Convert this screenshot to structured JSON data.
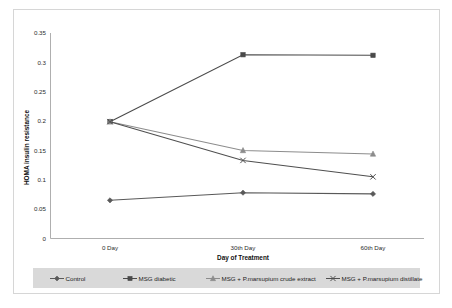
{
  "chart_data": {
    "type": "line",
    "title": "",
    "xlabel": "Day of Treatment",
    "ylabel": "HOMA insulin resistance",
    "categories": [
      "0 Day",
      "30th Day",
      "60th Day"
    ],
    "ylim": [
      0,
      0.35
    ],
    "yticks": [
      "0",
      "0.05",
      "0.1",
      "0.15",
      "0.2",
      "0.25",
      "0.3",
      "0.35"
    ],
    "ytick_values": [
      0,
      0.05,
      0.1,
      0.15,
      0.2,
      0.25,
      0.3,
      0.35
    ],
    "grid": false,
    "legend_position": "bottom",
    "series": [
      {
        "name": "Control",
        "values": [
          0.065,
          0.078,
          0.076
        ],
        "color": "#595959",
        "marker": "diamond"
      },
      {
        "name": "MSG diabetic",
        "values": [
          0.199,
          0.313,
          0.312
        ],
        "color": "#4a4a4a",
        "marker": "square"
      },
      {
        "name": "MSG + P.marsupium crude extract",
        "values": [
          0.199,
          0.15,
          0.144
        ],
        "color": "#8c8c8c",
        "marker": "triangle"
      },
      {
        "name": "MSG + P.marsupium distillate",
        "values": [
          0.199,
          0.133,
          0.105
        ],
        "color": "#4f4f4f",
        "marker": "cross"
      }
    ]
  },
  "axes": {
    "y_title": "HOMA insulin resistance",
    "x_title": "Day of Treatment"
  },
  "legend": {
    "items": [
      {
        "label": "Control"
      },
      {
        "label": "MSG diabetic"
      },
      {
        "label": "MSG + P.marsupium crude extract"
      },
      {
        "label": "MSG + P.marsupium distillate"
      }
    ]
  }
}
